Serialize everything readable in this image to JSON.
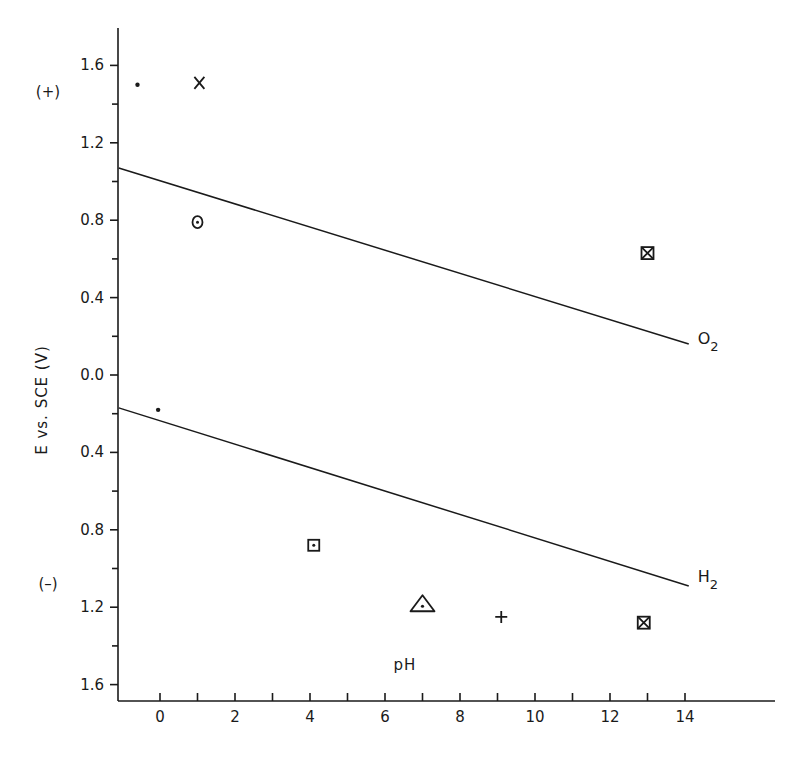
{
  "chart_data": {
    "type": "scatter",
    "title": "",
    "xlabel": "pH",
    "ylabel": "E vs. SCE (V)",
    "xlim": [
      -1.1,
      16.4
    ],
    "ylim": [
      -1.75,
      1.78
    ],
    "x_ticks": [
      {
        "value": 0,
        "label": "0"
      },
      {
        "value": 2,
        "label": "2"
      },
      {
        "value": 4,
        "label": "4"
      },
      {
        "value": 6,
        "label": "6"
      },
      {
        "value": 8,
        "label": "8"
      },
      {
        "value": 10,
        "label": "10"
      },
      {
        "value": 12,
        "label": "12"
      },
      {
        "value": 14,
        "label": "14"
      }
    ],
    "x_minor_ticks": [
      1,
      3,
      5,
      7,
      9,
      11,
      13
    ],
    "y_ticks": [
      {
        "value": 1.6,
        "label": "1.6"
      },
      {
        "value": 1.2,
        "label": "1.2"
      },
      {
        "value": 0.8,
        "label": "0.8"
      },
      {
        "value": 0.4,
        "label": "0.4"
      },
      {
        "value": 0.0,
        "label": "0.0"
      },
      {
        "value": -0.4,
        "label": "0.4"
      },
      {
        "value": -0.8,
        "label": "0.8"
      },
      {
        "value": -1.2,
        "label": "1.2"
      },
      {
        "value": -1.6,
        "label": "1.6"
      }
    ],
    "y_minor_ticks": [
      1.4,
      1.0,
      0.6,
      0.2,
      -0.2,
      -0.6,
      -1.0,
      -1.4
    ],
    "sign_labels": [
      {
        "text": "(+)",
        "value": 1.46
      },
      {
        "text": "(–)",
        "value": -1.08
      }
    ],
    "grid": false,
    "lines": [
      {
        "name": "O2",
        "label_main": "O",
        "label_sub": "2",
        "x": [
          -1.1,
          14.1
        ],
        "y": [
          1.07,
          0.16
        ]
      },
      {
        "name": "H2",
        "label_main": "H",
        "label_sub": "2",
        "x": [
          -1.1,
          14.1
        ],
        "y": [
          -0.17,
          -1.09
        ]
      }
    ],
    "points": [
      {
        "marker": "dot",
        "x": -0.6,
        "y": 1.5
      },
      {
        "marker": "x",
        "x": 1.05,
        "y": 1.51
      },
      {
        "marker": "circle-dot",
        "x": 1.0,
        "y": 0.79
      },
      {
        "marker": "boxed-x",
        "x": 13.0,
        "y": 0.63
      },
      {
        "marker": "dot",
        "x": -0.05,
        "y": -0.18
      },
      {
        "marker": "boxed-dot",
        "x": 4.1,
        "y": -0.88
      },
      {
        "marker": "triangle-dot",
        "x": 7.0,
        "y": -1.19
      },
      {
        "marker": "plus",
        "x": 9.1,
        "y": -1.25
      },
      {
        "marker": "boxed-x",
        "x": 12.9,
        "y": -1.28
      }
    ]
  }
}
